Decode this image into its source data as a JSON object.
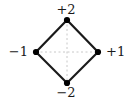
{
  "figure": {
    "width": 132,
    "height": 104,
    "background_color": "#ffffff"
  },
  "labels": {
    "top": "+2",
    "right": "+1",
    "bottom": "−2",
    "left": "−1"
  },
  "style": {
    "edge_color": "#1a1a1a",
    "edge_width": 2.2,
    "vertex_color": "#000000",
    "vertex_radius": 3.1,
    "axis_color": "#c8c8c8",
    "axis_width": 1,
    "axis_dash": "2,2.5",
    "label_color": "#1a1a1a",
    "label_font_size": 13
  },
  "chart_data": {
    "type": "scatter",
    "title": "",
    "xlabel": "",
    "ylabel": "",
    "grid": false,
    "legend": null,
    "xlim": [
      -1,
      1
    ],
    "ylim": [
      -2,
      2
    ],
    "vertices": [
      {
        "name": "top",
        "label": "+2",
        "x": 0,
        "y": 2,
        "px": 67,
        "py": 20
      },
      {
        "name": "right",
        "label": "+1",
        "x": 1,
        "y": 0,
        "px": 98,
        "py": 52
      },
      {
        "name": "bottom",
        "label": "−2",
        "x": 0,
        "y": -2,
        "px": 67,
        "py": 83
      },
      {
        "name": "left",
        "label": "−1",
        "x": -1,
        "y": 0,
        "px": 36,
        "py": 52
      }
    ],
    "edges": [
      {
        "from": "left",
        "to": "top"
      },
      {
        "from": "top",
        "to": "right"
      },
      {
        "from": "right",
        "to": "bottom"
      },
      {
        "from": "bottom",
        "to": "left"
      }
    ],
    "axes_dashed": [
      {
        "name": "horizontal-axis",
        "x1": 36,
        "y1": 52,
        "x2": 98,
        "y2": 52
      },
      {
        "name": "vertical-axis",
        "x1": 67,
        "y1": 20,
        "x2": 67,
        "y2": 83
      }
    ]
  }
}
